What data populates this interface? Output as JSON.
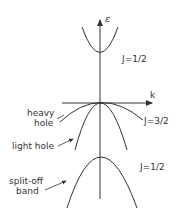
{
  "diagram": {
    "axes": {
      "y_label": "ε",
      "x_label": "k"
    },
    "bands": [
      {
        "name": "conduction",
        "label": "J=1/2",
        "curvature": "up"
      },
      {
        "name": "heavy-hole",
        "label": "heavy hole",
        "curvature": "down"
      },
      {
        "name": "light-hole",
        "label": "light hole",
        "curvature": "down"
      },
      {
        "name": "split-off",
        "label": "split-off band",
        "curvature": "down"
      }
    ],
    "labels": {
      "conduction_J": "J=1/2",
      "valence_J": "J=3/2",
      "splitoff_J": "J=1/2",
      "heavy_line1": "heavy",
      "heavy_line2": "hole",
      "light": "light hole",
      "splitoff_line1": "split-off",
      "splitoff_line2": "band"
    },
    "colors": {
      "line": "#333333",
      "background": "#ffffff"
    }
  }
}
